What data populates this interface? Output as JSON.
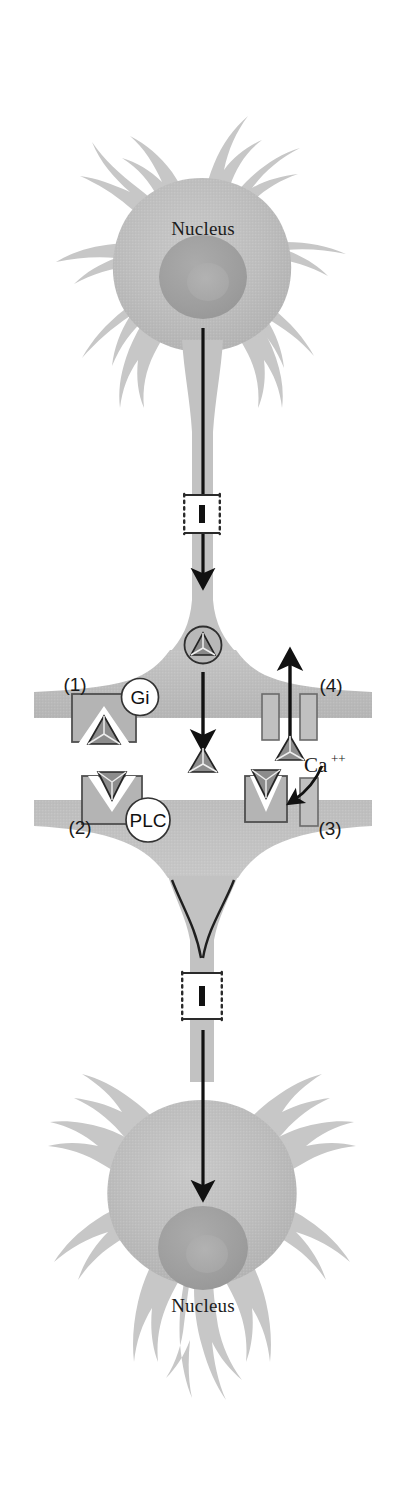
{
  "figure": {
    "width": 404,
    "height": 1493,
    "background_color": "#ffffff"
  },
  "colors": {
    "cell_body_fill": "#b9b9b9",
    "cell_body_fill_light": "#c6c6c6",
    "nucleus_fill": "#a0a0a0",
    "nucleolus_fill": "#ababab",
    "dendrite_fill": "#c9c9c9",
    "receptor_fill": "#b4b4b4",
    "receptor_stroke": "#4f4f4f",
    "channel_fill": "#c0c0c0",
    "channel_stroke": "#6a6a6a",
    "protein_fill": "#8c8c8c",
    "protein_stroke": "#2b2b2b",
    "arrow_color": "#111111",
    "label_color": "#1a1a1a",
    "circle_fill": "#ffffff",
    "circle_stroke": "#333333",
    "axon_break_stroke": "#2a2a2a"
  },
  "neurons": {
    "presynaptic": {
      "name": "presynaptic-neuron",
      "nucleus_label": "Nucleus"
    },
    "postsynaptic": {
      "name": "postsynaptic-neuron",
      "nucleus_label": "Nucleus"
    }
  },
  "synapse": {
    "vesicle": {
      "name": "neurotransmitter-vesicle",
      "contains": "transmitter-triangle"
    },
    "released_transmitter": {
      "name": "released-transmitter",
      "shape": "triangle"
    },
    "cleft_arrow": {
      "name": "release-arrow",
      "direction": "down"
    }
  },
  "annotations": {
    "items": [
      {
        "id": "1",
        "number_label": "(1)",
        "circle_label": "Gi",
        "element": "presynaptic-autoreceptor",
        "description": "Presynaptic receptor coupled to Gi protein"
      },
      {
        "id": "2",
        "number_label": "(2)",
        "circle_label": "PLC",
        "element": "postsynaptic-receptor",
        "description": "Postsynaptic receptor coupled to phospholipase C"
      },
      {
        "id": "3",
        "number_label": "(3)",
        "circle_label": "",
        "element": "postsynaptic-calcium-channel",
        "description": "Postsynaptic calcium channel"
      },
      {
        "id": "4",
        "number_label": "(4)",
        "circle_label": "",
        "element": "presynaptic-calcium-channel",
        "description": "Presynaptic calcium channel with efflux arrow"
      }
    ],
    "ion_label": {
      "base": "Ca",
      "superscript": "++",
      "full": "Ca++"
    }
  },
  "axon": {
    "upper_break_label": "axon-break-upper",
    "lower_break_label": "axon-break-lower",
    "impulse_arrow_upper": "down",
    "impulse_arrow_lower": "down"
  }
}
